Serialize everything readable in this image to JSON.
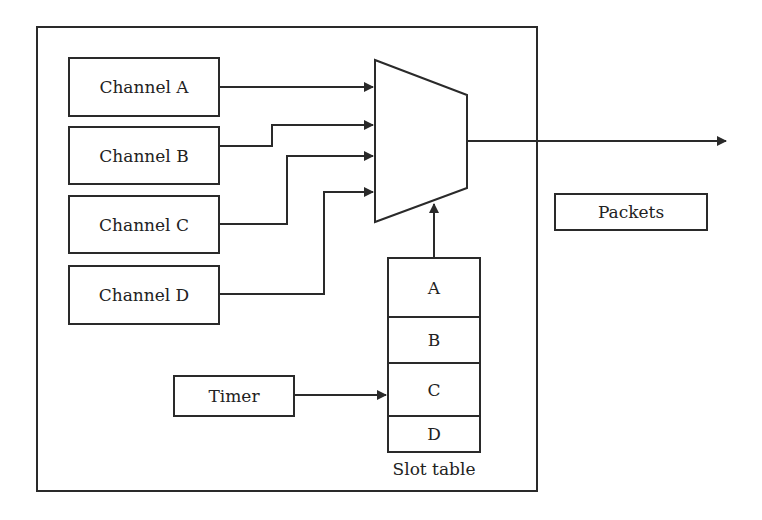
{
  "diagram": {
    "channels": [
      {
        "label": "Channel A"
      },
      {
        "label": "Channel B"
      },
      {
        "label": "Channel C"
      },
      {
        "label": "Channel D"
      }
    ],
    "timer": {
      "label": "Timer"
    },
    "slot_table": {
      "caption": "Slot table",
      "slots": [
        "A",
        "B",
        "C",
        "D"
      ]
    },
    "output": {
      "label": "Packets"
    },
    "colors": {
      "line": "#2a2a2a",
      "background": "#ffffff"
    }
  }
}
